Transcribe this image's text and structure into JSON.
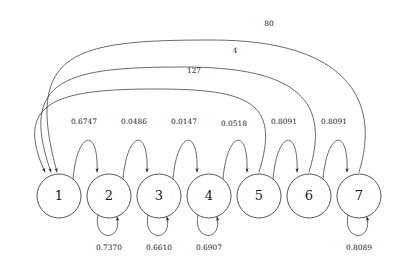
{
  "figure": {
    "type": "state-transition-diagram",
    "background_color": "#ffffff",
    "stroke_color": "#2b2b2b",
    "text_color": "#1a1a1a"
  },
  "nodes": [
    {
      "id": "1",
      "label": "1",
      "cx": 59,
      "cy": 196,
      "r": 22
    },
    {
      "id": "2",
      "label": "2",
      "cx": 109,
      "cy": 196,
      "r": 22
    },
    {
      "id": "3",
      "label": "3",
      "cx": 159,
      "cy": 196,
      "r": 22
    },
    {
      "id": "4",
      "label": "4",
      "cx": 209,
      "cy": 196,
      "r": 22
    },
    {
      "id": "5",
      "label": "5",
      "cx": 259,
      "cy": 196,
      "r": 22
    },
    {
      "id": "6",
      "label": "6",
      "cx": 309,
      "cy": 196,
      "r": 22
    },
    {
      "id": "7",
      "label": "7",
      "cx": 359,
      "cy": 196,
      "r": 22
    }
  ],
  "forward_edges": [
    {
      "from": "1",
      "to": "2",
      "label": "0.6747",
      "label_x": 84,
      "label_y": 122
    },
    {
      "from": "2",
      "to": "3",
      "label": "0.0486",
      "label_x": 134,
      "label_y": 122
    },
    {
      "from": "3",
      "to": "4",
      "label": "0.0147",
      "label_x": 184,
      "label_y": 122
    },
    {
      "from": "4",
      "to": "5",
      "label": "0.0518",
      "label_x": 234,
      "label_y": 124
    },
    {
      "from": "5",
      "to": "6",
      "label": "0.8091",
      "label_x": 284,
      "label_y": 122
    },
    {
      "from": "6",
      "to": "7",
      "label": "0.8091",
      "label_x": 334,
      "label_y": 122
    }
  ],
  "self_loops": [
    {
      "node": "2",
      "label": "0.7370",
      "label_x": 109,
      "label_y": 248
    },
    {
      "node": "3",
      "label": "0.6610",
      "label_x": 159,
      "label_y": 248
    },
    {
      "node": "4",
      "label": "0.6907",
      "label_x": 209,
      "label_y": 248
    },
    {
      "node": "7",
      "label": "0.8089",
      "label_x": 359,
      "label_y": 248
    }
  ],
  "return_edges": [
    {
      "from": "5",
      "to": "1",
      "label": "127",
      "label_x": 194,
      "label_y": 71
    },
    {
      "from": "6",
      "to": "1",
      "label": "4",
      "label_x": 235,
      "label_y": 51
    },
    {
      "from": "7",
      "to": "1",
      "label": "80",
      "label_x": 269,
      "label_y": 24
    }
  ]
}
